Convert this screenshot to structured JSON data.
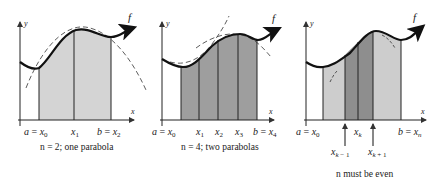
{
  "panels": [
    {
      "id": "panel-1",
      "axis_y_label": "y",
      "axis_x_label": "x",
      "function_label": "f",
      "tick_labels": [
        "a = x0",
        "x1",
        "b = x2"
      ],
      "caption": "n = 2; one parabola"
    },
    {
      "id": "panel-2",
      "axis_y_label": "y",
      "axis_x_label": "x",
      "function_label": "f",
      "tick_labels": [
        "a = x0",
        "x1",
        "x2",
        "x3",
        "b = x4"
      ],
      "caption": "n = 4; two parabolas"
    },
    {
      "id": "panel-3",
      "axis_y_label": "y",
      "axis_x_label": "x",
      "function_label": "f",
      "tick_labels": [
        "a = x0",
        "xk",
        "b = xn"
      ],
      "arrow_labels": [
        "xk − 1",
        "xk + 1"
      ],
      "caption": "n must be even"
    }
  ],
  "colors": {
    "light_fill": "#cfcfcf",
    "medium_fill": "#a9a9a9",
    "dark_fill": "#8c8c8c",
    "curve": "#111111"
  }
}
